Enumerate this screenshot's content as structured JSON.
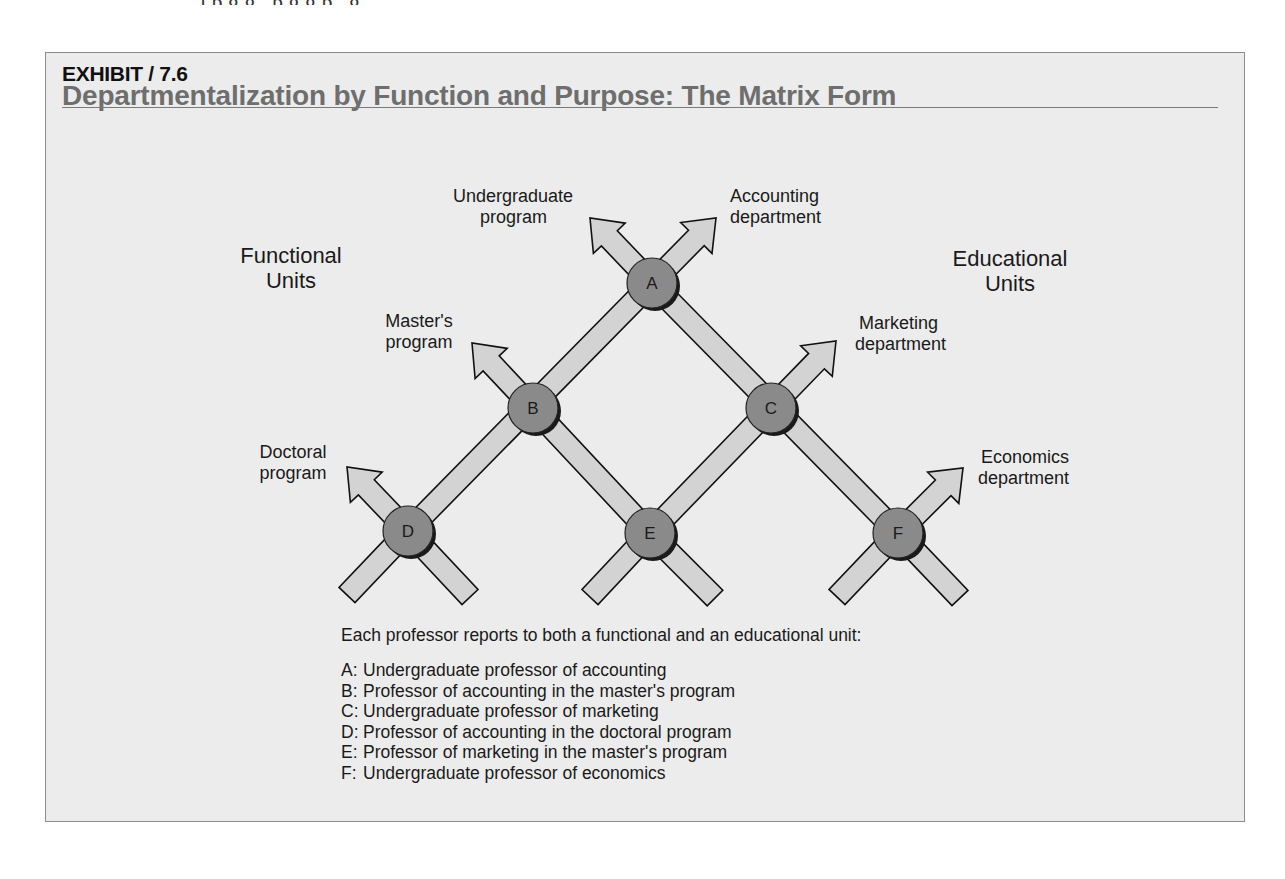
{
  "page": {
    "cutoff_text": "ı  p       g              g      ,  p                  g  g  p  ,      g"
  },
  "exhibit": {
    "label": "EXHIBIT / 7.6",
    "title": "Departmentalization by Function and Purpose: The Matrix Form",
    "colors": {
      "box_background": "#ececec",
      "box_border": "#8c8c8c",
      "title": "#6e6e6e",
      "bar_fill": "#d3d3d3",
      "bar_stroke": "#111111",
      "node_fill": "#8a8a8a",
      "node_shadow": "#1a1a1a"
    }
  },
  "diagram": {
    "unit_headings": {
      "functional": {
        "line1": "Functional",
        "line2": "Units"
      },
      "educational": {
        "line1": "Educational",
        "line2": "Units"
      }
    },
    "functional_units": [
      {
        "id": "undergraduate",
        "line1": "Undergraduate",
        "line2": "program"
      },
      {
        "id": "masters",
        "line1": "Master's",
        "line2": "program"
      },
      {
        "id": "doctoral",
        "line1": "Doctoral",
        "line2": "program"
      }
    ],
    "educational_units": [
      {
        "id": "accounting",
        "line1": "Accounting",
        "line2": "department"
      },
      {
        "id": "marketing",
        "line1": "Marketing",
        "line2": "department"
      },
      {
        "id": "economics",
        "line1": "Economics",
        "line2": "department"
      }
    ],
    "nodes": [
      {
        "id": "A",
        "x": 652,
        "y": 283
      },
      {
        "id": "B",
        "x": 533,
        "y": 408
      },
      {
        "id": "C",
        "x": 771,
        "y": 408
      },
      {
        "id": "D",
        "x": 408,
        "y": 531
      },
      {
        "id": "E",
        "x": 650,
        "y": 533
      },
      {
        "id": "F",
        "x": 898,
        "y": 533
      }
    ],
    "bars": [
      {
        "from": [
          652,
          283
        ],
        "to": [
          408,
          531
        ],
        "type": "segment"
      },
      {
        "from": [
          652,
          283
        ],
        "to": [
          898,
          533
        ],
        "type": "segment"
      },
      {
        "from": [
          771,
          408
        ],
        "to": [
          650,
          533
        ],
        "type": "segment"
      },
      {
        "from": [
          533,
          408
        ],
        "to": [
          650,
          533
        ],
        "type": "segment"
      },
      {
        "from": [
          652,
          283
        ],
        "to": [
          590,
          218
        ],
        "type": "arrow"
      },
      {
        "from": [
          652,
          283
        ],
        "to": [
          716,
          218
        ],
        "type": "arrow"
      },
      {
        "from": [
          533,
          408
        ],
        "to": [
          472,
          343
        ],
        "type": "arrow"
      },
      {
        "from": [
          771,
          408
        ],
        "to": [
          836,
          341
        ],
        "type": "arrow"
      },
      {
        "from": [
          408,
          531
        ],
        "to": [
          347,
          467
        ],
        "type": "arrow"
      },
      {
        "from": [
          898,
          533
        ],
        "to": [
          963,
          468
        ],
        "type": "arrow"
      },
      {
        "from": [
          408,
          531
        ],
        "to": [
          347,
          595
        ],
        "type": "tail"
      },
      {
        "from": [
          408,
          531
        ],
        "to": [
          470,
          597
        ],
        "type": "tail"
      },
      {
        "from": [
          650,
          533
        ],
        "to": [
          590,
          597
        ],
        "type": "tail"
      },
      {
        "from": [
          650,
          533
        ],
        "to": [
          715,
          598
        ],
        "type": "tail"
      },
      {
        "from": [
          898,
          533
        ],
        "to": [
          837,
          597
        ],
        "type": "tail"
      },
      {
        "from": [
          898,
          533
        ],
        "to": [
          960,
          598
        ],
        "type": "tail"
      }
    ],
    "legend": {
      "intro": "Each professor reports to both a functional and an educational unit:",
      "items": [
        {
          "key": "A:",
          "text": "Undergraduate professor of accounting"
        },
        {
          "key": "B:",
          "text": "Professor of accounting in the master's program"
        },
        {
          "key": "C:",
          "text": "Undergraduate professor of marketing"
        },
        {
          "key": "D:",
          "text": "Professor of accounting in the doctoral program"
        },
        {
          "key": "E:",
          "text": "Professor of marketing in the master's program"
        },
        {
          "key": "F:",
          "text": "Undergraduate professor of economics"
        }
      ]
    }
  }
}
